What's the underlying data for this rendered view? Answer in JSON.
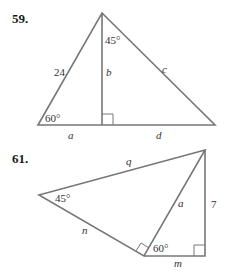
{
  "problems": [
    {
      "number": "59.",
      "labels": {
        "top_angle": "45°",
        "left_side": "24",
        "altitude": "b",
        "right_side": "c",
        "bottom_left_angle": "60°",
        "base_left": "a",
        "base_right": "d"
      }
    },
    {
      "number": "61.",
      "labels": {
        "top_side": "q",
        "left_angle": "45°",
        "left_bottom_side": "n",
        "middle_side": "a",
        "right_side": "7",
        "bottom_angle": "60°",
        "bottom_side": "m"
      }
    }
  ],
  "colors": {
    "line": "#777777",
    "text": "#333333"
  }
}
